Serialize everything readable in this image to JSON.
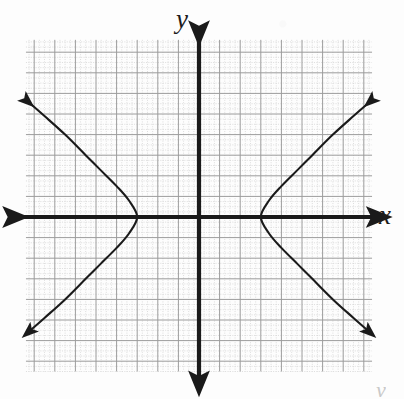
{
  "figure": {
    "title": "",
    "axis_labels": {
      "x": "x",
      "y": "y"
    },
    "corner_mark": "y"
  },
  "chart_data": {
    "type": "line",
    "title": "",
    "xlabel": "x",
    "ylabel": "y",
    "grid": true,
    "minor_grid": true,
    "legend": "none",
    "xlim": [
      -8.5,
      8.5
    ],
    "ylim": [
      -8,
      8
    ],
    "major_tick_spacing": 1,
    "minor_subdivisions": 4,
    "axes": {
      "x_axis": {
        "arrows": "both",
        "y_value": 0
      },
      "y_axis": {
        "arrows": "both",
        "x_value": 0
      }
    },
    "annotations": [],
    "series": [
      {
        "name": "hyperbola-left-branch",
        "equation": "x^2/9 - y^2/16 = 1  (x <= -3)",
        "color": "#1a1a1a",
        "arrow_start": true,
        "arrow_end": true,
        "points": [
          {
            "x": -8.3,
            "y": 5.6
          },
          {
            "x": -7.5,
            "y": 4.9
          },
          {
            "x": -6.5,
            "y": 4.0
          },
          {
            "x": -5.5,
            "y": 3.0
          },
          {
            "x": -4.8,
            "y": 2.3
          },
          {
            "x": -4.0,
            "y": 1.5
          },
          {
            "x": -3.4,
            "y": 0.8
          },
          {
            "x": -3.0,
            "y": 0.0
          },
          {
            "x": -3.4,
            "y": -0.8
          },
          {
            "x": -4.0,
            "y": -1.5
          },
          {
            "x": -4.8,
            "y": -2.3
          },
          {
            "x": -5.5,
            "y": -3.0
          },
          {
            "x": -6.5,
            "y": -4.0
          },
          {
            "x": -7.5,
            "y": -4.9
          },
          {
            "x": -8.3,
            "y": -5.6
          }
        ]
      },
      {
        "name": "hyperbola-right-branch",
        "equation": "x^2/9 - y^2/16 = 1  (x >= 3)",
        "color": "#1a1a1a",
        "arrow_start": true,
        "arrow_end": true,
        "points": [
          {
            "x": 8.3,
            "y": 5.6
          },
          {
            "x": 7.5,
            "y": 4.9
          },
          {
            "x": 6.5,
            "y": 4.0
          },
          {
            "x": 5.5,
            "y": 3.0
          },
          {
            "x": 4.8,
            "y": 2.3
          },
          {
            "x": 4.0,
            "y": 1.5
          },
          {
            "x": 3.4,
            "y": 0.8
          },
          {
            "x": 3.0,
            "y": 0.0
          },
          {
            "x": 3.4,
            "y": -0.8
          },
          {
            "x": 4.0,
            "y": -1.5
          },
          {
            "x": 4.8,
            "y": -2.3
          },
          {
            "x": 5.5,
            "y": -3.0
          },
          {
            "x": 6.5,
            "y": -4.0
          },
          {
            "x": 7.5,
            "y": -4.9
          },
          {
            "x": 8.3,
            "y": -5.6
          }
        ]
      }
    ],
    "vertices": [
      {
        "x": -3,
        "y": 0
      },
      {
        "x": 3,
        "y": 0
      }
    ]
  },
  "colors": {
    "background": "#fdfdfd",
    "major_grid": "#9a9a9a",
    "minor_grid": "#c4c4c4",
    "axis": "#1a1a1a",
    "curve": "#1a1a1a",
    "label": "#1c1c1c"
  }
}
